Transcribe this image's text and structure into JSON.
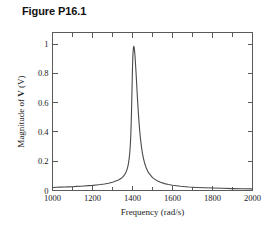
{
  "figure": {
    "title": "Figure P16.1"
  },
  "chart_data": {
    "type": "line",
    "title": "Figure P16.1",
    "xlabel": "Frequency (rad/s)",
    "ylabel_prefix": "Magnitude of ",
    "ylabel_symbol": "V",
    "ylabel_suffix": " (V)",
    "ylabel": "Magnitude of V (V)",
    "xlim": [
      1000,
      2000
    ],
    "ylim": [
      0,
      1.08
    ],
    "grid": false,
    "legend": false,
    "x_major_ticks": [
      1000,
      1200,
      1400,
      1600,
      1800,
      2000
    ],
    "x_major_tick_labels": [
      "1000",
      "1200",
      "1400",
      "1600",
      "1800",
      "2000"
    ],
    "x_minor_ticks": [
      1100,
      1300,
      1500,
      1700,
      1900
    ],
    "y_major_ticks": [
      0,
      0.2,
      0.4,
      0.6,
      0.8,
      1
    ],
    "y_major_tick_labels": [
      "0",
      "0.2",
      "0.4",
      "0.6",
      "0.8",
      "1"
    ],
    "resonance": {
      "peak_frequency": 1400,
      "peak_value": 1.0,
      "half_width": 14
    },
    "series": [
      {
        "name": "Magnitude of V",
        "x": [
          1000,
          1020,
          1040,
          1060,
          1080,
          1100,
          1120,
          1140,
          1160,
          1180,
          1200,
          1220,
          1240,
          1260,
          1280,
          1300,
          1310,
          1320,
          1330,
          1340,
          1345,
          1350,
          1355,
          1360,
          1364,
          1368,
          1372,
          1375,
          1378,
          1381,
          1384,
          1386,
          1388,
          1390,
          1392,
          1394,
          1396,
          1398,
          1400,
          1402,
          1404,
          1406,
          1408,
          1410,
          1412,
          1414,
          1416,
          1419,
          1422,
          1425,
          1428,
          1432,
          1436,
          1440,
          1445,
          1450,
          1455,
          1460,
          1470,
          1480,
          1500,
          1520,
          1540,
          1560,
          1580,
          1600,
          1640,
          1680,
          1720,
          1760,
          1800,
          1850,
          1900,
          1950,
          2000
        ],
        "y": [
          0.021,
          0.022,
          0.023,
          0.024,
          0.025,
          0.026,
          0.028,
          0.029,
          0.031,
          0.033,
          0.035,
          0.038,
          0.041,
          0.045,
          0.05,
          0.057,
          0.061,
          0.066,
          0.072,
          0.08,
          0.085,
          0.091,
          0.098,
          0.107,
          0.116,
          0.127,
          0.141,
          0.155,
          0.172,
          0.195,
          0.226,
          0.254,
          0.289,
          0.335,
          0.398,
          0.482,
          0.593,
          0.722,
          0.84,
          0.925,
          0.968,
          0.985,
          0.98,
          0.96,
          0.929,
          0.89,
          0.846,
          0.774,
          0.699,
          0.626,
          0.557,
          0.476,
          0.408,
          0.352,
          0.296,
          0.252,
          0.218,
          0.19,
          0.15,
          0.122,
          0.088,
          0.069,
          0.056,
          0.047,
          0.041,
          0.036,
          0.029,
          0.024,
          0.021,
          0.019,
          0.017,
          0.015,
          0.013,
          0.012,
          0.011
        ]
      }
    ]
  }
}
